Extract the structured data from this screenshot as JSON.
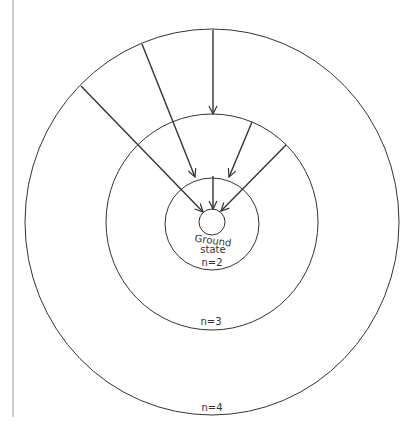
{
  "diagram": {
    "labels": {
      "ground_line1": "Ground",
      "ground_line2": "state",
      "n2": "n=2",
      "n3": "n=3",
      "n4": "n=4"
    },
    "levels": [
      {
        "name": "ground",
        "r": 13
      },
      {
        "name": "n=2",
        "r": 47
      },
      {
        "name": "n=3",
        "r": 107
      },
      {
        "name": "n=4",
        "r": 192
      }
    ],
    "transitions": [
      {
        "from": "n=4",
        "to": "ground"
      },
      {
        "from": "n=4",
        "to": "n=2"
      },
      {
        "from": "n=4",
        "to": "n=3"
      },
      {
        "from": "n=3",
        "to": "n=2"
      },
      {
        "from": "n=3",
        "to": "ground"
      },
      {
        "from": "n=2",
        "to": "ground"
      }
    ],
    "colors": {
      "stroke": "#333333",
      "background": "#ffffff"
    }
  }
}
